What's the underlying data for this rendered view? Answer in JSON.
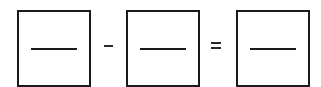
{
  "equation": {
    "boxes": [
      {
        "id": "operand-1",
        "value": ""
      },
      {
        "id": "operand-2",
        "value": ""
      },
      {
        "id": "result",
        "value": ""
      }
    ],
    "operators": [
      {
        "symbol": "-",
        "name": "minus"
      },
      {
        "symbol": "=",
        "name": "equals"
      }
    ]
  },
  "colors": {
    "stroke": "#1a1a1a",
    "background": "#ffffff"
  }
}
